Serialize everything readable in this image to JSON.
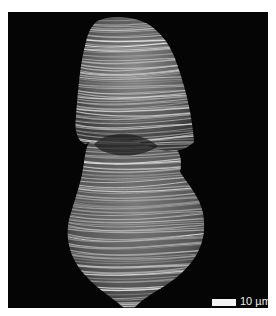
{
  "figure": {
    "type": "scanning electron micrograph",
    "background_color": "#050505",
    "scale_bar": {
      "label": "10 µm",
      "value": 10,
      "unit": "µm",
      "color": "#f2f2f2"
    }
  }
}
